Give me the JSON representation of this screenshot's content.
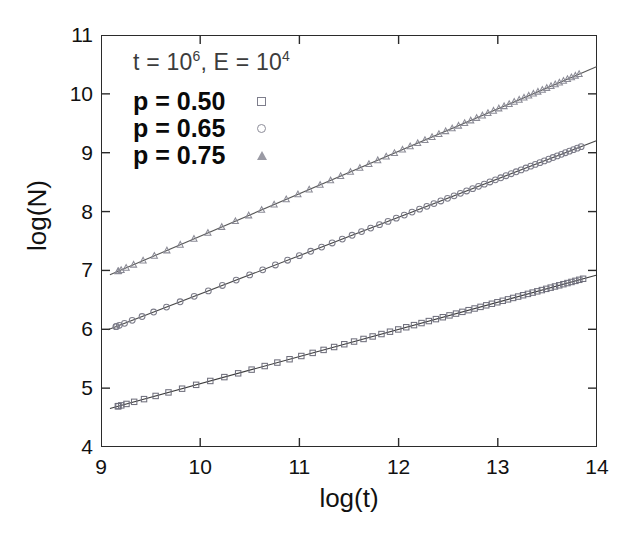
{
  "chart_data": {
    "type": "scatter",
    "title": "",
    "xlabel": "log(t)",
    "ylabel": "log(N)",
    "xlim": [
      9,
      14
    ],
    "ylim": [
      4,
      11
    ],
    "xticks": [
      "9",
      "10",
      "11",
      "12",
      "13",
      "14"
    ],
    "yticks": [
      "4",
      "5",
      "6",
      "7",
      "8",
      "9",
      "10",
      "11"
    ],
    "grid": false,
    "legend_position": "upper-left-inside",
    "annotation": {
      "prefix_t": "t = 10",
      "exp_t": "6",
      "middle": ", E = 10",
      "exp_e": "4",
      "full": "t = 10^6, E = 10^4"
    },
    "series": [
      {
        "name": "p = 0.50",
        "marker": "square",
        "color": "#6f6f7c",
        "line_color": "#2a2a2a",
        "slope": 0.462,
        "intercept": 0.455,
        "x_start": 9.17,
        "x_end": 13.86,
        "y_start": 4.7,
        "y_end": 6.86,
        "n_points": 62
      },
      {
        "name": "p = 0.65",
        "marker": "circle",
        "color": "#7d7d8a",
        "line_color": "#3a3a3a",
        "slope": 0.652,
        "intercept": 0.079,
        "x_start": 9.15,
        "x_end": 13.84,
        "y_start": 6.05,
        "y_end": 9.11,
        "n_points": 62
      },
      {
        "name": "p = 0.75",
        "marker": "triangle",
        "color": "#8b8b96",
        "line_color": "#4a4a4a",
        "slope": 0.721,
        "intercept": 0.371,
        "x_start": 9.17,
        "x_end": 13.82,
        "y_start": 6.98,
        "y_end": 10.34,
        "n_points": 62
      }
    ]
  },
  "axes": {
    "x_title": "log(t)",
    "y_title": "log(N)"
  },
  "legend": {
    "items": [
      {
        "label": "p = 0.50",
        "marker": "square-marker"
      },
      {
        "label": "p = 0.65",
        "marker": "circle-marker"
      },
      {
        "label": "p = 0.75",
        "marker": "triangle-marker"
      }
    ]
  },
  "colors": {
    "frame": "#2b2b2b",
    "text": "#111111",
    "annotation": "#3c3c3c",
    "background": "#ffffff"
  }
}
